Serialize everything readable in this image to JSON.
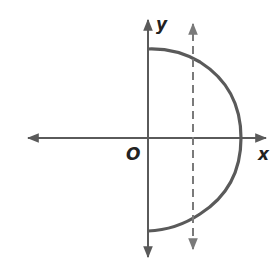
{
  "diagram": {
    "labels": {
      "y_axis": "y",
      "x_axis": "x",
      "origin": "O"
    },
    "colors": {
      "axis": "#5a5a5a",
      "curve": "#5a5a5a",
      "dashed_line": "#7a7a7a",
      "text": "#222222"
    }
  }
}
